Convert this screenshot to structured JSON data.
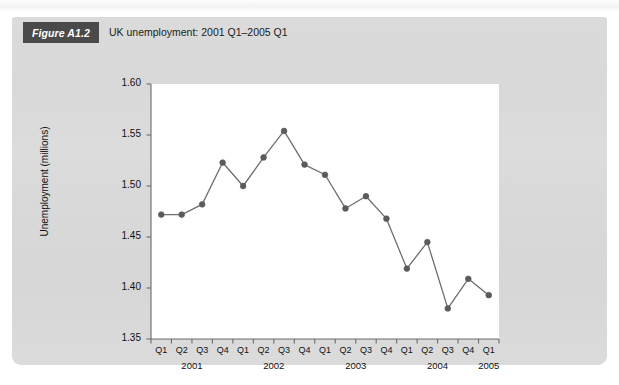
{
  "figure": {
    "badge_label": "Figure A1.2",
    "title": "UK unemployment: 2001 Q1–2005 Q1"
  },
  "colors": {
    "panel_background": "#d9d9d9",
    "plot_background": "#ffffff",
    "badge_background": "#4a4a4a",
    "badge_text": "#ffffff",
    "series_line": "#6e6e6e",
    "series_marker": "#5b5b5b",
    "axis": "#6b6b6b",
    "text": "#111111"
  },
  "chart_data": {
    "type": "line",
    "title": "UK unemployment: 2001 Q1–2005 Q1",
    "xlabel": "",
    "ylabel": "Unemployment (millions)",
    "ylim": [
      1.35,
      1.6
    ],
    "ytick_labels": [
      "1.60",
      "1.55",
      "1.50",
      "1.45",
      "1.40",
      "1.35"
    ],
    "ytick_values": [
      1.6,
      1.55,
      1.5,
      1.45,
      1.4,
      1.35
    ],
    "grid": false,
    "legend": "none",
    "quarter_labels": [
      "Q1",
      "Q2",
      "Q3",
      "Q4",
      "Q1",
      "Q2",
      "Q3",
      "Q4",
      "Q1",
      "Q2",
      "Q3",
      "Q4",
      "Q1",
      "Q2",
      "Q3",
      "Q4",
      "Q1"
    ],
    "year_groups": [
      {
        "year": "2001",
        "start_index": 0,
        "span": 4
      },
      {
        "year": "2002",
        "start_index": 4,
        "span": 4
      },
      {
        "year": "2003",
        "start_index": 8,
        "span": 4
      },
      {
        "year": "2004",
        "start_index": 12,
        "span": 4
      },
      {
        "year": "2005",
        "start_index": 16,
        "span": 1
      }
    ],
    "categories": [
      "2001 Q1",
      "2001 Q2",
      "2001 Q3",
      "2001 Q4",
      "2002 Q1",
      "2002 Q2",
      "2002 Q3",
      "2002 Q4",
      "2003 Q1",
      "2003 Q2",
      "2003 Q3",
      "2003 Q4",
      "2004 Q1",
      "2004 Q2",
      "2004 Q3",
      "2004 Q4",
      "2005 Q1"
    ],
    "series": [
      {
        "name": "Unemployment (millions)",
        "values": [
          1.472,
          1.472,
          1.482,
          1.523,
          1.5,
          1.528,
          1.554,
          1.521,
          1.511,
          1.478,
          1.49,
          1.468,
          1.419,
          1.445,
          1.38,
          1.409,
          1.393
        ]
      }
    ]
  }
}
